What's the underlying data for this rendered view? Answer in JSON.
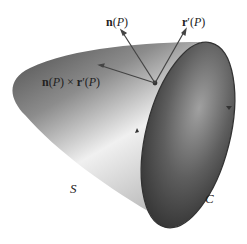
{
  "diagram": {
    "labels": {
      "normal": {
        "n": "n",
        "arg": "(P)",
        "italic_P": "P"
      },
      "tangent": {
        "r": "r",
        "prime": "′",
        "arg": "(P)"
      },
      "cross": {
        "n": "n",
        "arg1": "(P)",
        "times": " × ",
        "r": "r",
        "prime": "′",
        "arg2": "(P)"
      },
      "surface": "S",
      "curve": "C"
    },
    "colors": {
      "surface_dark": "#3a3a3a",
      "surface_mid": "#8a8a8a",
      "surface_light": "#e8e8e8",
      "rim_dark": "#2e2e2e",
      "vector": "#444444",
      "outline": "#333333"
    }
  }
}
